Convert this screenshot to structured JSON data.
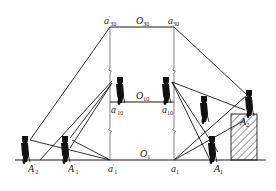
{
  "diagram": {
    "type": "surveying-vertical-projection",
    "labels": {
      "top_left": {
        "base": "a",
        "prime": "′",
        "sub": "30"
      },
      "top_center": {
        "base": "O",
        "prime": "",
        "sub": "30"
      },
      "top_right": {
        "base": "a",
        "prime": "",
        "sub": "30"
      },
      "mid_center": {
        "base": "O",
        "prime": "",
        "sub": "10"
      },
      "mid_left": {
        "base": "a",
        "prime": "′",
        "sub": "10"
      },
      "mid_right": {
        "base": "a",
        "prime": "",
        "sub": "10"
      },
      "ground_center": {
        "base": "O",
        "prime": "",
        "sub": "1"
      },
      "ground_a1p": {
        "base": "a",
        "prime": "′",
        "sub": "1"
      },
      "ground_a1": {
        "base": "a",
        "prime": "",
        "sub": "1"
      },
      "ground_A2p": {
        "base": "A",
        "prime": "′",
        "sub": "2"
      },
      "ground_A1p": {
        "base": "A",
        "prime": "′",
        "sub": "1"
      },
      "ground_A1": {
        "base": "A",
        "prime": "",
        "sub": "1"
      },
      "building_A2": {
        "base": "A",
        "prime": "",
        "sub": "2"
      }
    },
    "elements": [
      "ground-line",
      "vertical-axis-left",
      "vertical-axis-right",
      "level-30",
      "level-10",
      "sight-lines",
      "surveyors-with-theodolites",
      "hatched-building"
    ],
    "colors": {
      "line": "#1a1a1a",
      "background": "#ffffff"
    }
  }
}
